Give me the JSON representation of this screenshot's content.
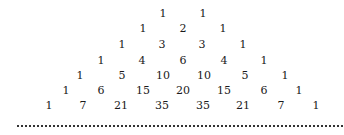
{
  "pascal_triangle": {
    "rows": [
      [
        "1",
        "1"
      ],
      [
        "1",
        "2",
        "1"
      ],
      [
        "1",
        "3",
        "3",
        "1"
      ],
      [
        "1",
        "4",
        "6",
        "4",
        "1"
      ],
      [
        "1",
        "5",
        "10",
        "10",
        "5",
        "1"
      ],
      [
        "1",
        "6",
        "15",
        "20",
        "15",
        "6",
        "1"
      ],
      [
        "1",
        "7",
        "21",
        "35",
        "35",
        "21",
        "7",
        "1"
      ]
    ]
  }
}
